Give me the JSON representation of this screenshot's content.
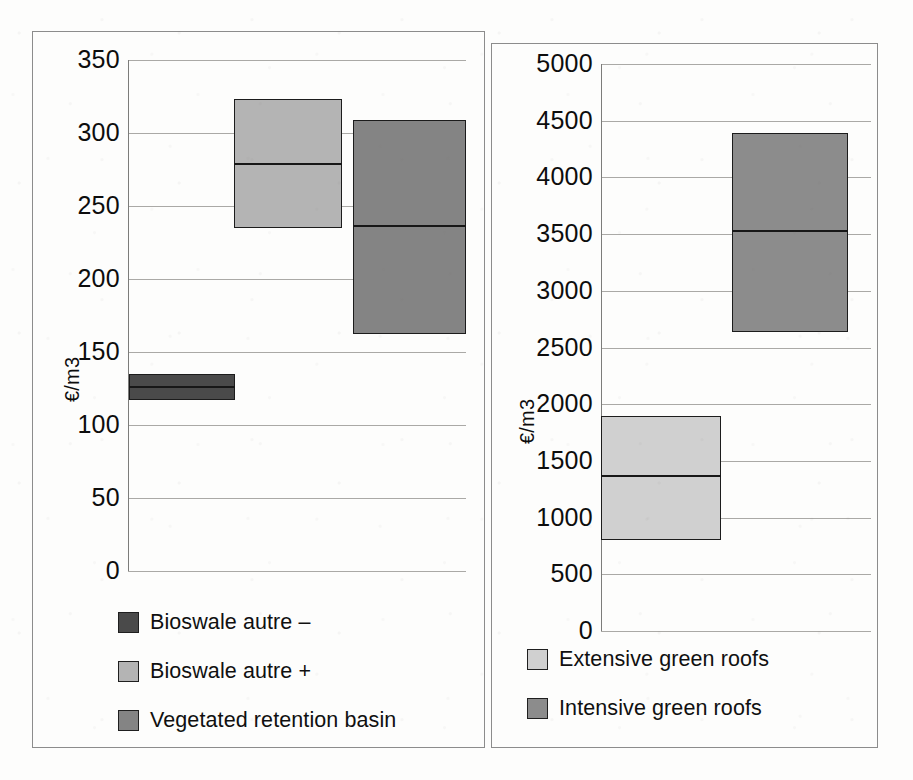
{
  "figure": {
    "panels": [
      "left",
      "right"
    ]
  },
  "chart_data": [
    {
      "panel": "left",
      "type": "bar",
      "subtype": "floating-range-bar-with-median",
      "title": "",
      "xlabel": "",
      "ylabel": "€/m3",
      "ylim": [
        0,
        350
      ],
      "ytick_labels": [
        "350",
        "300",
        "250",
        "200",
        "150",
        "100",
        "50",
        "0"
      ],
      "ytick_values": [
        350,
        300,
        250,
        200,
        150,
        100,
        50,
        0
      ],
      "grid": true,
      "legend_position": "below-plot-left",
      "categories": [
        "Bioswale autre –",
        "Bioswale autre +",
        "Vegetated retention basin"
      ],
      "series": [
        {
          "name": "Bioswale autre –",
          "low": 117,
          "median": 126,
          "high": 135,
          "color": "#4a4a4a"
        },
        {
          "name": "Bioswale autre +",
          "low": 235,
          "median": 279,
          "high": 323,
          "color": "#b4b4b4"
        },
        {
          "name": "Vegetated retention basin",
          "low": 162,
          "median": 236,
          "high": 309,
          "color": "#848484"
        }
      ]
    },
    {
      "panel": "right",
      "type": "bar",
      "subtype": "floating-range-bar-with-median",
      "title": "",
      "xlabel": "",
      "ylabel": "€/m3",
      "ylim": [
        0,
        5000
      ],
      "ytick_labels": [
        "5000",
        "4500",
        "4000",
        "3500",
        "3000",
        "2500",
        "2000",
        "1500",
        "1000",
        "500",
        "0"
      ],
      "ytick_values": [
        5000,
        4500,
        4000,
        3500,
        3000,
        2500,
        2000,
        1500,
        1000,
        500,
        0
      ],
      "grid": true,
      "legend_position": "below-plot-left",
      "categories": [
        "Extensive green roofs",
        "Intensive green roofs"
      ],
      "series": [
        {
          "name": "Extensive green roofs",
          "low": 800,
          "median": 1370,
          "high": 1900,
          "color": "#d0d0d0"
        },
        {
          "name": "Intensive green roofs",
          "low": 2640,
          "median": 3530,
          "high": 4390,
          "color": "#8c8c8c"
        }
      ]
    }
  ],
  "left_chart": {
    "ylabel": "€/m3",
    "ticks": [
      "350",
      "300",
      "250",
      "200",
      "150",
      "100",
      "50",
      "0"
    ],
    "legend": [
      {
        "label": "Bioswale autre –",
        "color": "#4a4a4a"
      },
      {
        "label": "Bioswale autre +",
        "color": "#b4b4b4"
      },
      {
        "label": "Vegetated retention basin",
        "color": "#848484"
      }
    ]
  },
  "right_chart": {
    "ylabel": "€/m3",
    "ticks": [
      "5000",
      "4500",
      "4000",
      "3500",
      "3000",
      "2500",
      "2000",
      "1500",
      "1000",
      "500",
      "0"
    ],
    "legend": [
      {
        "label": "Extensive green roofs",
        "color": "#d0d0d0"
      },
      {
        "label": "Intensive green roofs",
        "color": "#8c8c8c"
      }
    ]
  }
}
